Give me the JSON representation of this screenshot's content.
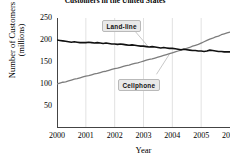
{
  "chart_data": {
    "type": "line",
    "title": "Customers in the United States",
    "xlabel": "Year",
    "ylabel": "Number of Customers",
    "ylabel_units": "(millions)",
    "xlim": [
      2000,
      2006
    ],
    "ylim": [
      0,
      250
    ],
    "xticks": [
      "2000",
      "2001",
      "2002",
      "2003",
      "2004",
      "2005",
      "2006"
    ],
    "yticks": [
      "50",
      "100",
      "150",
      "200",
      "250"
    ],
    "grid": "vertical-only",
    "legend": "inline-callouts",
    "series": [
      {
        "name": "Land-line",
        "color": "#111111",
        "x": [
          2000.0,
          2000.1,
          2000.2,
          2000.3,
          2000.4,
          2000.5,
          2000.6,
          2000.7,
          2000.8,
          2000.9,
          2001.0,
          2001.1,
          2001.2,
          2001.3,
          2001.4,
          2001.5,
          2001.6,
          2001.7,
          2001.8,
          2001.9,
          2002.0,
          2002.1,
          2002.2,
          2002.3,
          2002.4,
          2002.5,
          2002.6,
          2002.7,
          2002.8,
          2002.9,
          2003.0,
          2003.1,
          2003.2,
          2003.3,
          2003.4,
          2003.5,
          2003.6,
          2003.7,
          2003.8,
          2003.9,
          2004.0,
          2004.1,
          2004.2,
          2004.3,
          2004.4,
          2004.5,
          2004.6,
          2004.7,
          2004.8,
          2004.9,
          2005.0,
          2005.1,
          2005.2,
          2005.3,
          2005.4,
          2005.5,
          2005.6,
          2005.7,
          2005.8,
          2005.9,
          2006.0
        ],
        "values": [
          200,
          199,
          198,
          197,
          196,
          195,
          196,
          195,
          194,
          194,
          194,
          195,
          194,
          193,
          194,
          193,
          192,
          193,
          192,
          191,
          191,
          190,
          191,
          190,
          189,
          188,
          189,
          188,
          187,
          186,
          186,
          185,
          184,
          185,
          184,
          183,
          182,
          183,
          182,
          181,
          181,
          180,
          179,
          178,
          179,
          178,
          177,
          176,
          176,
          175,
          175,
          174,
          175,
          177,
          176,
          175,
          174,
          174,
          173,
          173,
          173
        ]
      },
      {
        "name": "Cellphone",
        "color": "#7d7d7d",
        "x": [
          2000.0,
          2000.1,
          2000.2,
          2000.3,
          2000.4,
          2000.5,
          2000.6,
          2000.7,
          2000.8,
          2000.9,
          2001.0,
          2001.1,
          2001.2,
          2001.3,
          2001.4,
          2001.5,
          2001.6,
          2001.7,
          2001.8,
          2001.9,
          2002.0,
          2002.1,
          2002.2,
          2002.3,
          2002.4,
          2002.5,
          2002.6,
          2002.7,
          2002.8,
          2002.9,
          2003.0,
          2003.1,
          2003.2,
          2003.3,
          2003.4,
          2003.5,
          2003.6,
          2003.7,
          2003.8,
          2003.9,
          2004.0,
          2004.1,
          2004.2,
          2004.3,
          2004.4,
          2004.5,
          2004.6,
          2004.7,
          2004.8,
          2004.9,
          2005.0,
          2005.1,
          2005.2,
          2005.3,
          2005.4,
          2005.5,
          2005.6,
          2005.7,
          2005.8,
          2005.9,
          2006.0
        ],
        "values": [
          100,
          102,
          104,
          105,
          107,
          109,
          111,
          112,
          114,
          116,
          118,
          119,
          121,
          123,
          124,
          126,
          128,
          129,
          131,
          133,
          135,
          136,
          138,
          140,
          142,
          143,
          145,
          147,
          148,
          150,
          152,
          154,
          156,
          157,
          159,
          161,
          163,
          165,
          167,
          169,
          171,
          173,
          175,
          177,
          179,
          181,
          183,
          186,
          188,
          190,
          193,
          196,
          199,
          202,
          204,
          207,
          209,
          212,
          214,
          216,
          218
        ]
      }
    ],
    "annotations": [
      {
        "label": "Land-line",
        "points_to_series": "Land-line"
      },
      {
        "label": "Cellphone",
        "points_to_series": "Cellphone"
      }
    ]
  }
}
